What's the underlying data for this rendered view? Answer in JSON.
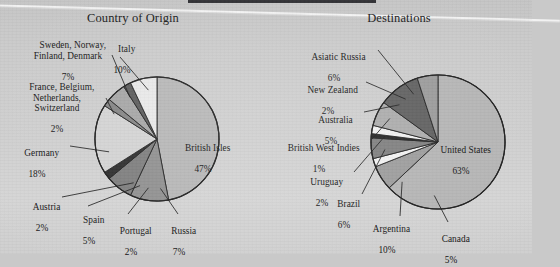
{
  "document": {
    "background_color": "#cccccc",
    "top_bar_color": "#2b2b2f"
  },
  "charts": [
    {
      "title": "Country of Origin",
      "center": [
        157,
        139
      ],
      "radius": 62
    },
    {
      "title": "Destinations",
      "center": [
        438,
        142
      ],
      "radius": 67
    }
  ],
  "chart_data": [
    {
      "type": "pie",
      "title": "Country of Origin",
      "xlabel": "",
      "ylabel": "",
      "legend_position": "callout-labels",
      "grid": false,
      "total_percent": 100,
      "categories": [
        "British Isles",
        "Italy",
        "Sweden, Norway, Finland, Denmark",
        "France, Belgium, Netherlands, Switzerland",
        "Germany",
        "Austria",
        "Spain",
        "Portugal",
        "Russia"
      ],
      "values": [
        47,
        10,
        7,
        2,
        18,
        2,
        5,
        2,
        7
      ],
      "labels": [
        {
          "name": "British Isles",
          "percent_text": "47%",
          "value": 47,
          "color": "#b6b6b6"
        },
        {
          "name": "Italy",
          "percent_text": "10%",
          "value": 10,
          "color": "#8f8f8f"
        },
        {
          "name": "Sweden, Norway,\nFinland, Denmark",
          "percent_text": "7%",
          "value": 7,
          "color": "#7d7d7d"
        },
        {
          "name": "France, Belgium,\nNetherlands,\nSwitzerland",
          "percent_text": "2%",
          "value": 2,
          "color": "#2c2c2c"
        },
        {
          "name": "Germany",
          "percent_text": "18%",
          "value": 18,
          "color": "#d3d3d3"
        },
        {
          "name": "Austria",
          "percent_text": "2%",
          "value": 2,
          "color": "#848484"
        },
        {
          "name": "Spain",
          "percent_text": "5%",
          "value": 5,
          "color": "#a5a5a5"
        },
        {
          "name": "Portugal",
          "percent_text": "2%",
          "value": 2,
          "color": "#5a5a5a"
        },
        {
          "name": "Russia",
          "percent_text": "7%",
          "value": 7,
          "color": "#e8e8e8"
        }
      ]
    },
    {
      "type": "pie",
      "title": "Destinations",
      "xlabel": "",
      "ylabel": "",
      "legend_position": "callout-labels",
      "grid": false,
      "total_percent": 100,
      "categories": [
        "United States",
        "Asiatic Russia",
        "New Zealand",
        "Australia",
        "British West Indies",
        "Uruguay",
        "Brazil",
        "Argentina",
        "Canada"
      ],
      "values": [
        63,
        6,
        2,
        5,
        1,
        2,
        6,
        10,
        5
      ],
      "labels": [
        {
          "name": "United States",
          "percent_text": "63%",
          "value": 63,
          "color": "#b4b4b4"
        },
        {
          "name": "Asiatic Russia",
          "percent_text": "6%",
          "value": 6,
          "color": "#9c9c9c"
        },
        {
          "name": "New Zealand",
          "percent_text": "2%",
          "value": 2,
          "color": "#f2f2f2"
        },
        {
          "name": "Australia",
          "percent_text": "5%",
          "value": 5,
          "color": "#7e7e7e"
        },
        {
          "name": "British West Indies",
          "percent_text": "1%",
          "value": 1,
          "color": "#232323"
        },
        {
          "name": "Uruguay",
          "percent_text": "2%",
          "value": 2,
          "color": "#f0f0f0"
        },
        {
          "name": "Brazil",
          "percent_text": "6%",
          "value": 6,
          "color": "#ababab"
        },
        {
          "name": "Argentina",
          "percent_text": "10%",
          "value": 10,
          "color": "#5e5e5e"
        },
        {
          "name": "Canada",
          "percent_text": "5%",
          "value": 5,
          "color": "#9a9a9a"
        }
      ]
    }
  ],
  "left_labels": {
    "british_isles": {
      "text": "British Isles",
      "pct": "47%"
    },
    "italy": {
      "text": "Italy",
      "pct": "10%"
    },
    "scandinavia": {
      "text": "Sweden, Norway,\nFinland, Denmark",
      "pct": "7%"
    },
    "low_countries": {
      "text": "France, Belgium,\nNetherlands,\nSwitzerland",
      "pct": "2%"
    },
    "germany": {
      "text": "Germany",
      "pct": "18%"
    },
    "austria": {
      "text": "Austria",
      "pct": "2%"
    },
    "spain": {
      "text": "Spain",
      "pct": "5%"
    },
    "portugal": {
      "text": "Portugal",
      "pct": "2%"
    },
    "russia": {
      "text": "Russia",
      "pct": "7%"
    }
  },
  "right_labels": {
    "united_states": {
      "text": "United States",
      "pct": "63%"
    },
    "asiatic_russia": {
      "text": "Asiatic Russia",
      "pct": "6%"
    },
    "new_zealand": {
      "text": "New Zealand",
      "pct": "2%"
    },
    "australia": {
      "text": "Australia",
      "pct": "5%"
    },
    "british_west_indies": {
      "text": "British West Indies",
      "pct": "1%"
    },
    "uruguay": {
      "text": "Uruguay",
      "pct": "2%"
    },
    "brazil": {
      "text": "Brazil",
      "pct": "6%"
    },
    "argentina": {
      "text": "Argentina",
      "pct": "10%"
    },
    "canada": {
      "text": "Canada",
      "pct": "5%"
    }
  }
}
